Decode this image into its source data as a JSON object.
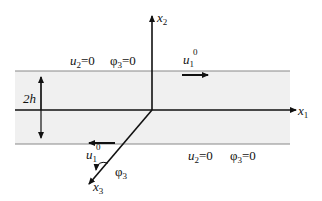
{
  "diagram": {
    "colors": {
      "band_fill": "#f0f0f0",
      "line": "#111111",
      "boundary_line": "#888888"
    },
    "axes": {
      "x1": {
        "base": "x",
        "sub": "1"
      },
      "x2": {
        "base": "x",
        "sub": "2"
      },
      "x3": {
        "base": "x",
        "sub": "3"
      }
    },
    "thickness_label": "2h",
    "top_boundary": {
      "cond1": {
        "var": "u",
        "sub": "2",
        "rest": "=0"
      },
      "cond2": {
        "var": "φ",
        "sub": "3",
        "rest": "=0"
      },
      "velocity": {
        "var": "u",
        "sub": "1",
        "sup": "0"
      }
    },
    "bottom_boundary": {
      "cond1": {
        "var": "u",
        "sub": "2",
        "rest": "=0"
      },
      "cond2": {
        "var": "φ",
        "sub": "3",
        "rest": "=0"
      },
      "velocity": {
        "var": "u",
        "sub": "1",
        "sup": "0"
      }
    },
    "rotation_label": {
      "var": "φ",
      "sub": "3"
    }
  }
}
